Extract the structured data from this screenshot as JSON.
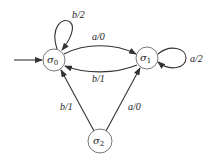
{
  "diagram": {
    "type": "finite-state machine (Mealy)",
    "states": [
      {
        "id": "s0",
        "label": "σ",
        "sub": "0",
        "x": 54,
        "y": 60,
        "initial": true
      },
      {
        "id": "s1",
        "label": "σ",
        "sub": "1",
        "x": 147,
        "y": 58
      },
      {
        "id": "s2",
        "label": "σ",
        "sub": "2",
        "x": 100,
        "y": 141
      }
    ],
    "edges": [
      {
        "from": "s0",
        "to": "s0",
        "label": "b/2"
      },
      {
        "from": "s0",
        "to": "s1",
        "label": "a/0"
      },
      {
        "from": "s1",
        "to": "s0",
        "label": "b/1"
      },
      {
        "from": "s1",
        "to": "s1",
        "label": "a/2"
      },
      {
        "from": "s2",
        "to": "s0",
        "label": "b/1"
      },
      {
        "from": "s2",
        "to": "s1",
        "label": "a/0"
      }
    ]
  },
  "labels": {
    "s0_loop": "b/2",
    "s0_s1": "a/0",
    "s1_s0": "b/1",
    "s1_loop": "a/2",
    "s2_s0": "b/1",
    "s2_s1": "a/0",
    "s0_name": "σ",
    "s0_sub": "0",
    "s1_name": "σ",
    "s1_sub": "1",
    "s2_name": "σ",
    "s2_sub": "2"
  }
}
